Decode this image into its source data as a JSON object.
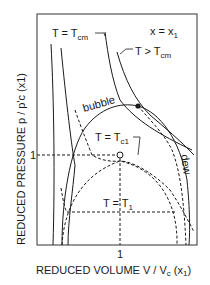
{
  "diagram": {
    "title": "",
    "x_axis": {
      "label_main": "REDUCED VOLUME V / V",
      "label_sub": "c",
      "label_tail": " (x",
      "label_tail_sub": "1",
      "label_close": ")",
      "tick": "1"
    },
    "y_axis": {
      "label": "REDUCED PRESSURE p / p'c (x1)",
      "tick": "1"
    },
    "annotations": {
      "composition": "x = x",
      "composition_sub": "1",
      "t_cm": "T = T",
      "t_cm_sub": "cm",
      "t_gt_cm": "T > T",
      "t_gt_cm_sub": "cm",
      "bubble": "bubble",
      "dew": "dew",
      "t_c1": "T = T",
      "t_c1_sub": "c1",
      "t_1": "T = T",
      "t_1_sub": "1"
    },
    "colors": {
      "line": "#1a1a1a",
      "background": "#ffffff"
    }
  }
}
